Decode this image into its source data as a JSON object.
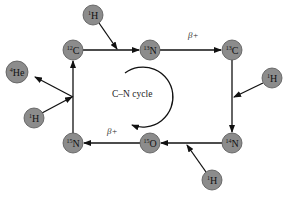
{
  "colors": {
    "node_fill": "#8c8c8c",
    "node_stroke": "#555555",
    "arrow": "#111111",
    "text": "#111111"
  },
  "nodes": [
    {
      "id": "H1_top",
      "mass": "1",
      "symbol": "H",
      "cx": 93,
      "cy": 15
    },
    {
      "id": "C12",
      "mass": "12",
      "symbol": "C",
      "cx": 73,
      "cy": 50
    },
    {
      "id": "N13",
      "mass": "13",
      "symbol": "N",
      "cx": 150,
      "cy": 50
    },
    {
      "id": "C13",
      "mass": "13",
      "symbol": "C",
      "cx": 232,
      "cy": 50
    },
    {
      "id": "H1_right",
      "mass": "1",
      "symbol": "H",
      "cx": 272,
      "cy": 78
    },
    {
      "id": "N14",
      "mass": "14",
      "symbol": "N",
      "cx": 232,
      "cy": 143
    },
    {
      "id": "H1_bottom",
      "mass": "1",
      "symbol": "H",
      "cx": 212,
      "cy": 180
    },
    {
      "id": "O15",
      "mass": "15",
      "symbol": "O",
      "cx": 150,
      "cy": 143
    },
    {
      "id": "N15",
      "mass": "15",
      "symbol": "N",
      "cx": 73,
      "cy": 143
    },
    {
      "id": "H1_left",
      "mass": "1",
      "symbol": "H",
      "cx": 34,
      "cy": 118
    },
    {
      "id": "He4",
      "mass": "4",
      "symbol": "He",
      "cx": 17,
      "cy": 72
    }
  ],
  "labels": {
    "beta_top": "β+",
    "beta_bottom": "β+",
    "cycle": "C–N cycle"
  }
}
